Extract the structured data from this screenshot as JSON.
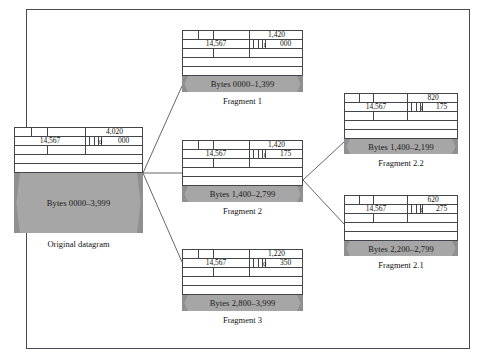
{
  "figure": {
    "clipped_top_text": "",
    "border_color": "#4a4a52",
    "payload_color": "#a6a6a6"
  },
  "diagram": {
    "type": "ip-fragmentation",
    "nodes": [
      {
        "id": "original",
        "caption": "Original datagram",
        "total_length": "4,020",
        "identification": "14,567",
        "more_fragments_flag": "0",
        "fragment_offset": "000",
        "payload_label": "Bytes 0000–3,999"
      },
      {
        "id": "frag1",
        "caption": "Fragment 1",
        "total_length": "1,420",
        "identification": "14,567",
        "more_fragments_flag": "1",
        "fragment_offset": "000",
        "payload_label": "Bytes 0000–1,399"
      },
      {
        "id": "frag2",
        "caption": "Fragment 2",
        "total_length": "1,420",
        "identification": "14,567",
        "more_fragments_flag": "1",
        "fragment_offset": "175",
        "payload_label": "Bytes 1,400–2,799"
      },
      {
        "id": "frag3",
        "caption": "Fragment 3",
        "total_length": "1,220",
        "identification": "14,567",
        "more_fragments_flag": "0",
        "fragment_offset": "350",
        "payload_label": "Bytes 2,800–3,999"
      },
      {
        "id": "frag22",
        "caption": "Fragment 2.2",
        "total_length": "820",
        "identification": "14,567",
        "more_fragments_flag": "1",
        "fragment_offset": "175",
        "payload_label": "Bytes 1,400–2,199"
      },
      {
        "id": "frag21",
        "caption": "Fragment 2.1",
        "total_length": "620",
        "identification": "14,567",
        "more_fragments_flag": "1",
        "fragment_offset": "275",
        "payload_label": "Bytes 2,200–2,799"
      }
    ]
  }
}
